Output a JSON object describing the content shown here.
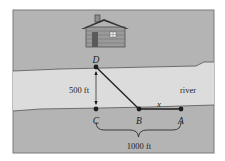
{
  "points": {
    "D": {
      "label": "D",
      "x": 96,
      "y": 67
    },
    "C": {
      "label": "C",
      "x": 96,
      "y": 109
    },
    "B": {
      "label": "B",
      "x": 139,
      "y": 109
    },
    "A": {
      "label": "A",
      "x": 181,
      "y": 109
    }
  },
  "labels": {
    "vertical_distance": "500 ft",
    "horizontal_distance": "1000 ft",
    "segment_BA": "x",
    "river": "river"
  },
  "colors": {
    "land": "#b4b4b4",
    "river": "#dcdcdc",
    "frame": "#7a7a7a",
    "line": "#1e1e1e",
    "cabin": "#8e8e8e",
    "cabin_dark": "#5a5a5a"
  }
}
